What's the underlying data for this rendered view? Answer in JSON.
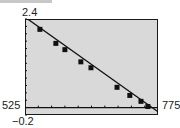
{
  "figure": {
    "ymax_label": "2.4",
    "ymin_label": "−0.2",
    "xmin_label": "525",
    "xmax_label": "775"
  },
  "colors": {
    "plot_background": "#d9d9d9",
    "line": "#111111",
    "frame": "#1a1a1a"
  },
  "chart_data": {
    "type": "scatter",
    "title": "",
    "xlabel": "",
    "ylabel": "",
    "xlim": [
      525,
      775
    ],
    "ylim": [
      -0.2,
      2.4
    ],
    "x_tick_step": 25,
    "y_tick_step": 0.2,
    "grid": false,
    "legend": null,
    "series": [
      {
        "name": "data",
        "x": [
          553,
          583,
          600,
          630,
          649,
          698,
          722,
          743,
          756
        ],
        "y": [
          2.12,
          1.74,
          1.57,
          1.24,
          1.08,
          0.55,
          0.33,
          0.17,
          0.03
        ]
      }
    ],
    "fit_line": {
      "x": [
        525,
        775
      ],
      "y": [
        2.45,
        -0.11
      ]
    }
  }
}
